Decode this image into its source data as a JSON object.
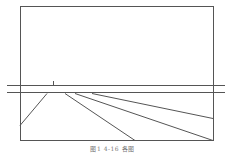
{
  "figure": {
    "caption": "图1  4-16   各图",
    "stroke_color": "#555555",
    "frame": {
      "x": 20,
      "y": 6,
      "width": 193,
      "height": 134
    },
    "horizontal_lines": [
      {
        "x1": 7,
        "y1": 85,
        "x2": 225,
        "y2": 85
      },
      {
        "x1": 7,
        "y1": 92,
        "x2": 225,
        "y2": 92
      }
    ],
    "tick": {
      "x1": 53,
      "y1": 81,
      "x2": 53,
      "y2": 85
    },
    "diagonals": [
      {
        "x1": 47,
        "y1": 93,
        "x2": 20,
        "y2": 125
      },
      {
        "x1": 65,
        "y1": 93,
        "x2": 135,
        "y2": 140
      },
      {
        "x1": 75,
        "y1": 93,
        "x2": 213,
        "y2": 140
      },
      {
        "x1": 92,
        "y1": 93,
        "x2": 213,
        "y2": 118
      }
    ]
  }
}
